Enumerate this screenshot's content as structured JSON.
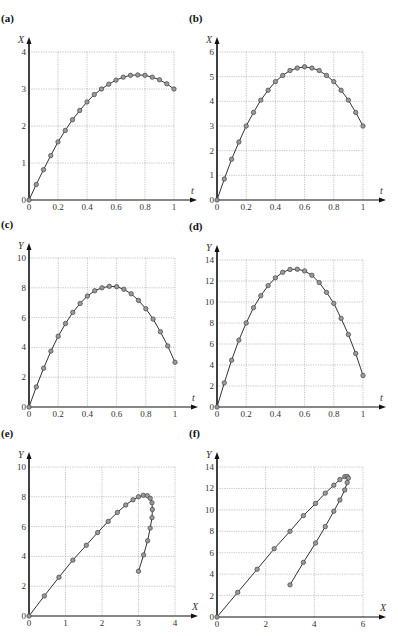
{
  "figure": {
    "background": "#ffffff",
    "line_color": "#333333",
    "marker_fill": "#9a9a9a",
    "marker_stroke": "#444444",
    "grid_color": "#9a9a9a",
    "axis_color": "#111111"
  },
  "chart_data": [
    {
      "panel_label": "(a)",
      "type": "line",
      "xlabel": "t",
      "ylabel": "X",
      "xlim": [
        0,
        1
      ],
      "ylim": [
        0,
        4
      ],
      "xticks": [
        0,
        0.2,
        0.4,
        0.6,
        0.8,
        1
      ],
      "xtick_labels": [
        "0",
        "0.2",
        "0.4",
        "0.6",
        "0.8",
        "1"
      ],
      "yticks": [
        0,
        1,
        2,
        3,
        4
      ],
      "ytick_labels": [
        "0",
        "1",
        "2",
        "3",
        "4"
      ],
      "grid": true,
      "markers": "circle",
      "x": [
        0,
        0.05,
        0.1,
        0.15,
        0.2,
        0.25,
        0.3,
        0.35,
        0.4,
        0.45,
        0.5,
        0.55,
        0.6,
        0.65,
        0.7,
        0.75,
        0.8,
        0.85,
        0.9,
        0.95,
        1
      ],
      "y": [
        0,
        0.42,
        0.82,
        1.2,
        1.57,
        1.88,
        2.17,
        2.42,
        2.65,
        2.85,
        3.0,
        3.13,
        3.24,
        3.32,
        3.37,
        3.38,
        3.37,
        3.32,
        3.25,
        3.14,
        3.0
      ],
      "box": {
        "left": 29,
        "top": 52,
        "right": 174,
        "bottom": 200
      }
    },
    {
      "panel_label": "(b)",
      "type": "line",
      "xlabel": "t",
      "ylabel": "X",
      "xlim": [
        0,
        1
      ],
      "ylim": [
        0,
        6
      ],
      "xticks": [
        0,
        0.2,
        0.4,
        0.6,
        0.8,
        1
      ],
      "xtick_labels": [
        "0",
        "0.2",
        "0.4",
        "0.6",
        "0.8",
        "1"
      ],
      "yticks": [
        0,
        1,
        2,
        3,
        4,
        5,
        6
      ],
      "ytick_labels": [
        "0",
        "1",
        "2",
        "3",
        "4",
        "5",
        "6"
      ],
      "grid": true,
      "markers": "circle",
      "x": [
        0,
        0.05,
        0.1,
        0.15,
        0.2,
        0.25,
        0.3,
        0.35,
        0.4,
        0.45,
        0.5,
        0.55,
        0.6,
        0.65,
        0.7,
        0.75,
        0.8,
        0.85,
        0.9,
        0.95,
        1
      ],
      "y": [
        0,
        0.85,
        1.65,
        2.35,
        3.0,
        3.55,
        4.05,
        4.45,
        4.8,
        5.05,
        5.25,
        5.35,
        5.4,
        5.35,
        5.25,
        5.05,
        4.8,
        4.45,
        4.05,
        3.55,
        3.0
      ],
      "box": {
        "left": 217,
        "top": 52,
        "right": 363,
        "bottom": 200
      }
    },
    {
      "panel_label": "(c)",
      "type": "line",
      "xlabel": "t",
      "ylabel": "Y",
      "xlim": [
        0,
        1
      ],
      "ylim": [
        0,
        10
      ],
      "xticks": [
        0,
        0.2,
        0.4,
        0.6,
        0.8,
        1
      ],
      "xtick_labels": [
        "0",
        "0.2",
        "0.4",
        "0.6",
        "0.8",
        "1"
      ],
      "yticks": [
        0,
        2,
        4,
        6,
        8,
        10
      ],
      "ytick_labels": [
        "0",
        "2",
        "4",
        "6",
        "8",
        "10"
      ],
      "grid": true,
      "markers": "circle",
      "x": [
        0,
        0.05,
        0.1,
        0.15,
        0.2,
        0.25,
        0.3,
        0.35,
        0.4,
        0.45,
        0.5,
        0.55,
        0.6,
        0.65,
        0.7,
        0.75,
        0.8,
        0.85,
        0.9,
        0.95,
        1
      ],
      "y": [
        0,
        1.35,
        2.6,
        3.75,
        4.75,
        5.6,
        6.35,
        6.95,
        7.45,
        7.8,
        8.0,
        8.1,
        8.08,
        7.9,
        7.6,
        7.15,
        6.6,
        5.9,
        5.05,
        4.1,
        3.0
      ],
      "box": {
        "left": 29,
        "top": 258,
        "right": 175,
        "bottom": 407
      }
    },
    {
      "panel_label": "(d)",
      "type": "line",
      "xlabel": "t",
      "ylabel": "Y",
      "xlim": [
        0,
        1
      ],
      "ylim": [
        0,
        14
      ],
      "xticks": [
        0,
        0.2,
        0.4,
        0.6,
        0.8,
        1
      ],
      "xtick_labels": [
        "0",
        "0.2",
        "0.4",
        "0.6",
        "0.8",
        "1"
      ],
      "yticks": [
        0,
        2,
        4,
        6,
        8,
        10,
        12,
        14
      ],
      "ytick_labels": [
        "0",
        "2",
        "4",
        "6",
        "8",
        "10",
        "12",
        "14"
      ],
      "grid": true,
      "markers": "circle",
      "x": [
        0,
        0.05,
        0.1,
        0.15,
        0.2,
        0.25,
        0.3,
        0.35,
        0.4,
        0.45,
        0.5,
        0.55,
        0.6,
        0.65,
        0.7,
        0.75,
        0.8,
        0.85,
        0.9,
        0.95,
        1
      ],
      "y": [
        0,
        2.3,
        4.46,
        6.37,
        8.0,
        9.46,
        10.6,
        11.56,
        12.3,
        12.83,
        13.1,
        13.12,
        12.96,
        12.55,
        11.85,
        10.92,
        9.87,
        8.44,
        6.9,
        5.1,
        3.0
      ],
      "box": {
        "left": 217,
        "top": 260,
        "right": 363,
        "bottom": 407
      }
    },
    {
      "panel_label": "(e)",
      "type": "line",
      "xlabel": "X",
      "ylabel": "Y",
      "xlim": [
        0,
        4
      ],
      "ylim": [
        0,
        10
      ],
      "xticks": [
        0,
        1,
        2,
        3,
        4
      ],
      "xtick_labels": [
        "0",
        "1",
        "2",
        "3",
        "4"
      ],
      "yticks": [
        0,
        2,
        4,
        6,
        8,
        10
      ],
      "ytick_labels": [
        "0",
        "2",
        "4",
        "6",
        "8",
        "10"
      ],
      "grid": true,
      "markers": "circle",
      "x": [
        0,
        0.42,
        0.82,
        1.2,
        1.57,
        1.88,
        2.17,
        2.42,
        2.65,
        2.85,
        3.0,
        3.13,
        3.24,
        3.32,
        3.37,
        3.38,
        3.37,
        3.32,
        3.25,
        3.14,
        3.0
      ],
      "y": [
        0,
        1.35,
        2.6,
        3.75,
        4.75,
        5.6,
        6.35,
        6.95,
        7.45,
        7.8,
        8.0,
        8.1,
        8.08,
        7.9,
        7.6,
        7.15,
        6.6,
        5.9,
        5.05,
        4.1,
        3.0
      ],
      "box": {
        "left": 29,
        "top": 467,
        "right": 175,
        "bottom": 616
      }
    },
    {
      "panel_label": "(f)",
      "type": "line",
      "xlabel": "X",
      "ylabel": "Y",
      "xlim": [
        0,
        6
      ],
      "ylim": [
        0,
        14
      ],
      "xticks": [
        0,
        2,
        4,
        6
      ],
      "xtick_labels": [
        "0",
        "2",
        "4",
        "6"
      ],
      "yticks": [
        0,
        2,
        4,
        6,
        8,
        10,
        12,
        14
      ],
      "ytick_labels": [
        "0",
        "2",
        "4",
        "6",
        "8",
        "10",
        "12",
        "14"
      ],
      "grid": true,
      "markers": "circle",
      "x": [
        0,
        0.85,
        1.65,
        2.35,
        3.0,
        3.55,
        4.05,
        4.45,
        4.8,
        5.05,
        5.25,
        5.35,
        5.4,
        5.35,
        5.25,
        5.05,
        4.8,
        4.45,
        4.05,
        3.55,
        3.0
      ],
      "y": [
        0,
        2.3,
        4.46,
        6.37,
        8.0,
        9.46,
        10.6,
        11.56,
        12.3,
        12.83,
        13.1,
        13.12,
        12.96,
        12.55,
        11.85,
        10.92,
        9.87,
        8.44,
        6.9,
        5.1,
        3.0
      ],
      "box": {
        "left": 217,
        "top": 467,
        "right": 363,
        "bottom": 617
      }
    }
  ]
}
